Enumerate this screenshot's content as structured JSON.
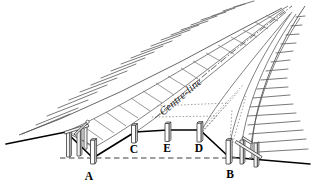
{
  "figure": {
    "background_color": "#ffffff",
    "line_color": "#000000",
    "hatch_color": "#6a6a6a",
    "datum_color": "#808080",
    "width": 316,
    "height": 186
  },
  "labels": {
    "centre_line": "Centre-line",
    "point_a": "A",
    "point_b": "B",
    "point_c": "C",
    "point_d": "D",
    "point_e": "E"
  },
  "annotations": {
    "a_description": "Left toe / shoulder peg on datum",
    "b_description": "Right toe / shoulder peg on datum",
    "c_description": "Left carriageway edge peg",
    "d_description": "Right carriageway edge peg",
    "e_description": "Centre-line peg",
    "datum_description": "Horizontal datum line between A and B",
    "hatching_description": "Hatched cut slopes either side of the road formation"
  },
  "elements": {
    "peg_count": 5,
    "stake_cluster_left": "profile boards at A",
    "stake_cluster_right": "profile boards at B"
  }
}
